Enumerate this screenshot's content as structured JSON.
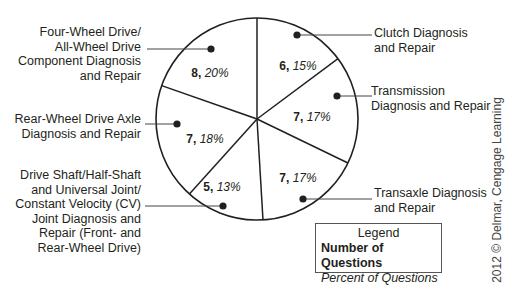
{
  "chart_data": {
    "type": "pie",
    "title": "",
    "center": [
      257,
      119
    ],
    "radius": 101,
    "start_angle_deg": -90,
    "slices": [
      {
        "name": "Clutch Diagnosis and Repair",
        "count": 6,
        "percent": "15%",
        "label_lines": [
          "Clutch Diagnosis",
          "and Repair"
        ],
        "end_angle_deg": -36.7,
        "value_pos": [
          298,
          66
        ],
        "dot": [
          297,
          35
        ],
        "leader_to": [
          372,
          35
        ],
        "label_pos": [
          374,
          26
        ],
        "align": "left"
      },
      {
        "name": "Transmission Diagnosis and Repair",
        "count": 7,
        "percent": "17%",
        "label_lines": [
          "Transmission",
          "Diagnosis and Repair"
        ],
        "end_angle_deg": 25.8,
        "value_pos": [
          312,
          117
        ],
        "dot": [
          337,
          96
        ],
        "leader_to": [
          372,
          96
        ],
        "label_pos": [
          371,
          84
        ],
        "align": "left"
      },
      {
        "name": "Transaxle Diagnosis and Repair",
        "count": 7,
        "percent": "17%",
        "label_lines": [
          "Transaxle Diagnosis",
          "and Repair"
        ],
        "end_angle_deg": 86.6,
        "value_pos": [
          298,
          178
        ],
        "dot": [
          303,
          199
        ],
        "leader_to": [
          372,
          199
        ],
        "label_pos": [
          374,
          186
        ],
        "align": "left"
      },
      {
        "name": "Drive Shaft/Half-Shaft and Universal Joint/Constant Velocity (CV) Joint Diagnosis and Repair (Front- and Rear-Wheel Drive)",
        "count": 5,
        "percent": "13%",
        "label_lines": [
          "Drive Shaft/Half-Shaft",
          "and Universal Joint/",
          "Constant Velocity (CV)",
          "Joint Diagnosis and",
          "Repair (Front- and",
          "Rear-Wheel Drive)"
        ],
        "end_angle_deg": 132.0,
        "value_pos": [
          222,
          187
        ],
        "dot": [
          223,
          206
        ],
        "leader_to": [
          145,
          206
        ],
        "label_pos": [
          141,
          168
        ],
        "align": "right"
      },
      {
        "name": "Rear-Wheel Drive Axle Diagnosis and Repair",
        "count": 7,
        "percent": "18%",
        "label_lines": [
          "Rear-Wheel Drive Axle",
          "Diagnosis and Repair"
        ],
        "end_angle_deg": 199.3,
        "value_pos": [
          205,
          139
        ],
        "dot": [
          177,
          124
        ],
        "leader_to": [
          145,
          124
        ],
        "label_pos": [
          141,
          112
        ],
        "align": "right"
      },
      {
        "name": "Four-Wheel Drive/All-Wheel Drive Component Diagnosis and Repair",
        "count": 8,
        "percent": "20%",
        "label_lines": [
          "Four-Wheel Drive/",
          "All-Wheel Drive",
          "Component Diagnosis",
          "and Repair"
        ],
        "end_angle_deg": 270,
        "value_pos": [
          210,
          73
        ],
        "dot": [
          211,
          49
        ],
        "leader_to": [
          147,
          49
        ],
        "label_pos": [
          141,
          25
        ],
        "align": "right"
      }
    ],
    "legend": {
      "title": "Legend",
      "bold_entry": "Number of Questions",
      "italic_entry": "Percent of Questions",
      "position": "bottom-right"
    }
  },
  "legend": {
    "title": "Legend",
    "number_label": "Number of Questions",
    "percent_label": "Percent of Questions"
  },
  "credit": "2012 © Delmar, Cengage Learning",
  "colors": {
    "line": "#231f20",
    "fill": "#ffffff",
    "text": "#231f20"
  }
}
